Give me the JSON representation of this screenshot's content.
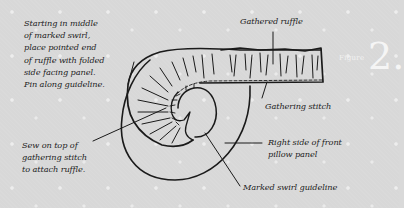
{
  "figure": {
    "label": "Figure",
    "number": "2."
  },
  "annotations": {
    "start_instruction": "Starting in middle\nof marked swirl,\nplace pointed end\nof ruffle with folded\nside facing panel.\nPin along guideline.",
    "sew_instruction": "Sew on top of\ngathering stitch\nto attach ruffle.",
    "gathered_ruffle": "Gathered ruffle",
    "gathering_stitch": "Gathering stitch",
    "right_side_panel": "Right side of front\npillow panel",
    "swirl_guideline": "Marked swirl guideline"
  },
  "colors": {
    "background": "#d8d8d8",
    "ink": "#1a1a1a",
    "figure_label": "#f5f5f5"
  }
}
